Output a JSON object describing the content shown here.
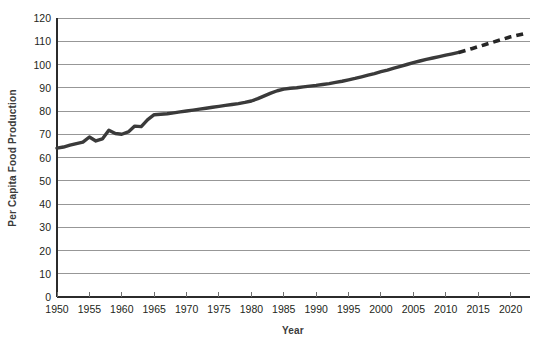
{
  "chart_data": {
    "type": "line",
    "title": "",
    "subtitle": "",
    "xlabel": "Year",
    "ylabel": "Per Capita Food Production",
    "xlim": [
      1950,
      2023
    ],
    "ylim": [
      0,
      120
    ],
    "grid": true,
    "grid_axis": "y",
    "legend": false,
    "legend_position": "none",
    "x_ticks": [
      1950,
      1955,
      1960,
      1965,
      1970,
      1975,
      1980,
      1985,
      1990,
      1995,
      2000,
      2005,
      2010,
      2015,
      2020
    ],
    "x_tick_labels": [
      "1950",
      "1955",
      "1960",
      "1965",
      "1970",
      "1975",
      "1980",
      "1985",
      "1990",
      "1995",
      "2000",
      "2005",
      "2010",
      "2015",
      "2020"
    ],
    "y_ticks": [
      0,
      10,
      20,
      30,
      40,
      50,
      60,
      70,
      80,
      90,
      100,
      110,
      120
    ],
    "y_tick_labels": [
      "0",
      "10",
      "20",
      "30",
      "40",
      "50",
      "60",
      "70",
      "80",
      "90",
      "100",
      "110",
      "120"
    ],
    "series": [
      {
        "name": "Per Capita Food Production (observed)",
        "style": "solid",
        "color": "#3a3a3a",
        "x": [
          1950,
          1951,
          1952,
          1953,
          1954,
          1955,
          1956,
          1957,
          1958,
          1959,
          1960,
          1961,
          1962,
          1963,
          1964,
          1965,
          1966,
          1967,
          1968,
          1969,
          1970,
          1971,
          1972,
          1973,
          1974,
          1975,
          1976,
          1977,
          1978,
          1979,
          1980,
          1981,
          1982,
          1983,
          1984,
          1985,
          1986,
          1987,
          1988,
          1989,
          1990,
          1991,
          1992,
          1993,
          1994,
          1995,
          1996,
          1997,
          1998,
          1999,
          2000,
          2001,
          2002,
          2003,
          2004,
          2005,
          2006,
          2007,
          2008,
          2009,
          2010,
          2011,
          2012
        ],
        "y": [
          64.0,
          64.5,
          65.3,
          66.0,
          66.6,
          68.8,
          67.1,
          68.0,
          71.7,
          70.3,
          70.0,
          71.0,
          73.5,
          73.3,
          76.3,
          78.4,
          78.6,
          78.8,
          79.2,
          79.6,
          80.0,
          80.4,
          80.8,
          81.2,
          81.6,
          82.0,
          82.4,
          82.8,
          83.2,
          83.7,
          84.3,
          85.3,
          86.5,
          87.7,
          88.7,
          89.4,
          89.8,
          90.0,
          90.4,
          90.7,
          91.0,
          91.4,
          91.8,
          92.3,
          92.8,
          93.4,
          94.0,
          94.7,
          95.4,
          96.1,
          96.9,
          97.6,
          98.4,
          99.2,
          100.0,
          100.8,
          101.5,
          102.2,
          102.8,
          103.4,
          104.0,
          104.6,
          105.2
        ]
      },
      {
        "name": "Per Capita Food Production (projected)",
        "style": "dashed",
        "color": "#262626",
        "x": [
          2012,
          2014,
          2016,
          2018,
          2020,
          2022
        ],
        "y": [
          105.2,
          106.8,
          108.5,
          110.2,
          111.9,
          113.2
        ]
      }
    ]
  },
  "axes": {
    "x_axis_title": "Year",
    "y_axis_title": "Per Capita Food Production"
  }
}
